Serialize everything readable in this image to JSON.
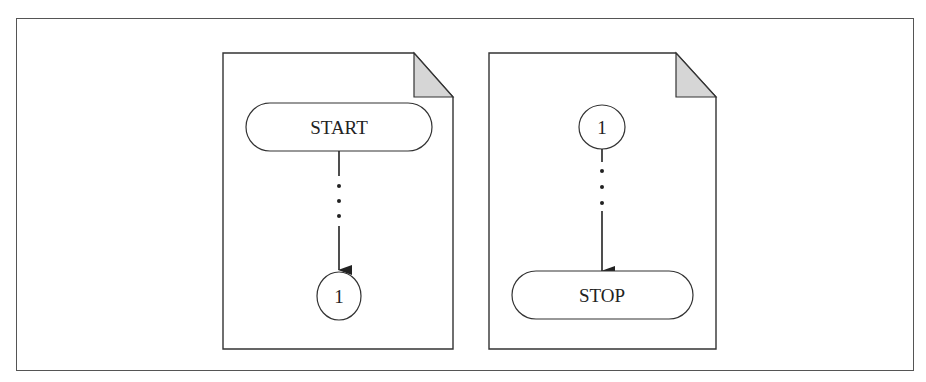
{
  "diagram": {
    "type": "flowchart-off-page-connectors",
    "colors": {
      "stroke": "#333333",
      "fold_fill": "#d6d6d6",
      "background": "#ffffff",
      "frame": "#555555"
    },
    "pages": [
      {
        "id": "page-1",
        "terminal": {
          "label": "START",
          "position": "top"
        },
        "connector": {
          "label": "1",
          "position": "bottom"
        },
        "flow": "START → ... → 1"
      },
      {
        "id": "page-2",
        "connector": {
          "label": "1",
          "position": "top"
        },
        "terminal": {
          "label": "STOP",
          "position": "bottom"
        },
        "flow": "1 → ... → STOP"
      }
    ]
  }
}
